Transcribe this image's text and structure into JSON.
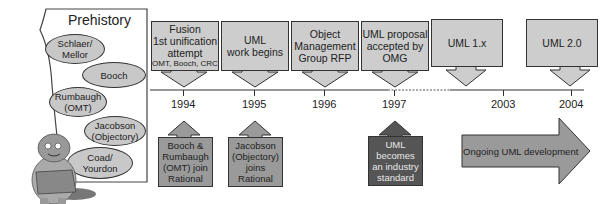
{
  "prehistory": {
    "title": "Prehistory",
    "methods": [
      {
        "line1": "Schlaer/",
        "line2": "Mellor"
      },
      {
        "line1": "Booch",
        "line2": ""
      },
      {
        "line1": "Rumbaugh",
        "line2": "(OMT)"
      },
      {
        "line1": "Jacobson",
        "line2": "(Objectory)"
      },
      {
        "line1": "Coad/",
        "line2": "Yourdon"
      }
    ],
    "mascot": "caveman-mascot"
  },
  "timeline": {
    "years": [
      "1994",
      "1995",
      "1996",
      "1997",
      "2003",
      "2004"
    ],
    "events_above": [
      {
        "lines": [
          "Fusion",
          "1st unification",
          "attempt"
        ],
        "small": "OMT, Booch, CRC",
        "year": "1994"
      },
      {
        "lines": [
          "UML",
          "work begins"
        ],
        "small": "",
        "year": "1995"
      },
      {
        "lines": [
          "Object",
          "Management",
          "Group RFP"
        ],
        "small": "",
        "year": "1996"
      },
      {
        "lines": [
          "UML proposal",
          "accepted by",
          "OMG"
        ],
        "small": "",
        "year": "1997"
      },
      {
        "lines": [
          "UML 1.x"
        ],
        "small": "",
        "year": "2003"
      },
      {
        "lines": [
          "UML 2.0"
        ],
        "small": "",
        "year": "2004"
      }
    ],
    "events_below": [
      {
        "lines": [
          "Booch &",
          "Rumbaugh",
          "(OMT) join",
          "Rational"
        ],
        "year": "1994",
        "style": "medium"
      },
      {
        "lines": [
          "Jacobson",
          "(Objectory)",
          "joins",
          "Rational"
        ],
        "year": "1995",
        "style": "medium"
      },
      {
        "lines": [
          "UML",
          "becomes",
          "an industry",
          "standard"
        ],
        "year": "1997",
        "style": "dark"
      }
    ],
    "ongoing_arrow": {
      "label": "Ongoing UML development"
    }
  },
  "colors": {
    "box_light": "#cdcdcd",
    "box_medium": "#9a9a9a",
    "box_dark": "#555555",
    "oval_fill": "#c8c8c8",
    "line": "#333333"
  }
}
